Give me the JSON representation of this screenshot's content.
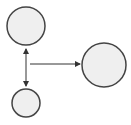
{
  "diagram": {
    "background": "#ffffff",
    "node_fill": "#efefef",
    "node_stroke": "#444444",
    "edge_color": "#333333",
    "nodes": [
      {
        "id": "node-top-left",
        "cx": 26,
        "cy": 26,
        "r": 19
      },
      {
        "id": "node-bottom-left",
        "cx": 26,
        "cy": 103,
        "r": 14
      },
      {
        "id": "node-right",
        "cx": 104,
        "cy": 65,
        "r": 22
      }
    ],
    "edges": [
      {
        "id": "edge-vertical-bidirectional",
        "x1": 26,
        "y1": 49,
        "x2": 26,
        "y2": 86,
        "arrow_start": true,
        "arrow_end": true
      },
      {
        "id": "edge-horizontal",
        "x1": 30,
        "y1": 64,
        "x2": 80,
        "y2": 64,
        "arrow_start": false,
        "arrow_end": true
      }
    ]
  }
}
